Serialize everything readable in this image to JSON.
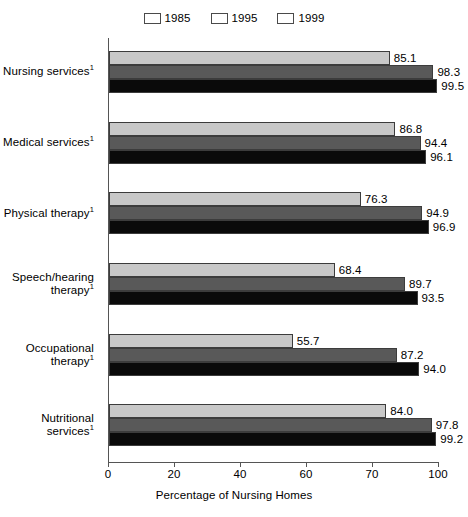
{
  "chart_data": {
    "type": "bar",
    "orientation": "horizontal",
    "title": "",
    "xlabel": "Percentage of Nursing Homes",
    "ylabel": "",
    "xlim": [
      0,
      100
    ],
    "xticks": [
      0,
      20,
      40,
      60,
      80,
      100
    ],
    "xtick_labels": [
      "0",
      "20",
      "40",
      "60",
      "70",
      "100"
    ],
    "grid": false,
    "legend_position": "top-center",
    "categories": [
      "Nursing services",
      "Medical services",
      "Physical therapy",
      "Speech/hearing\ntherapy",
      "Occupational\ntherapy",
      "Nutritional\nservices"
    ],
    "category_footnote": "1",
    "series": [
      {
        "name": "1985",
        "color": "#c8c8c8",
        "values": [
          85.1,
          86.8,
          76.3,
          68.4,
          55.7,
          84.0
        ],
        "labels": [
          "85.1",
          "86.8",
          "76.3",
          "68.4",
          "55.7",
          "84.0"
        ]
      },
      {
        "name": "1995",
        "color": "#595959",
        "values": [
          98.3,
          94.4,
          94.9,
          89.7,
          87.2,
          97.8
        ],
        "labels": [
          "98.3",
          "94.4",
          "94.9",
          "89.7",
          "87.2",
          "97.8"
        ]
      },
      {
        "name": "1999",
        "color": "#0a0a0a",
        "values": [
          99.5,
          96.1,
          96.9,
          93.5,
          94.0,
          99.2
        ],
        "labels": [
          "99.5",
          "96.1",
          "96.9",
          "93.5",
          "94.0",
          "99.2"
        ]
      }
    ]
  }
}
